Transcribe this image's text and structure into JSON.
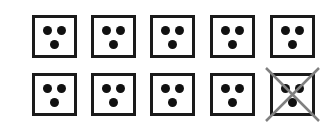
{
  "diagram": {
    "rows": 2,
    "columns": 5,
    "box_left_positions": [
      32,
      91,
      150,
      210,
      270
    ],
    "box_top_positions": [
      15,
      73
    ],
    "dots_per_box": 3,
    "boxes": [
      {
        "row": 0,
        "col": 0,
        "dots": 3,
        "crossed": false
      },
      {
        "row": 0,
        "col": 1,
        "dots": 3,
        "crossed": false
      },
      {
        "row": 0,
        "col": 2,
        "dots": 3,
        "crossed": false
      },
      {
        "row": 0,
        "col": 3,
        "dots": 3,
        "crossed": false
      },
      {
        "row": 0,
        "col": 4,
        "dots": 3,
        "crossed": false
      },
      {
        "row": 1,
        "col": 0,
        "dots": 3,
        "crossed": false
      },
      {
        "row": 1,
        "col": 1,
        "dots": 3,
        "crossed": false
      },
      {
        "row": 1,
        "col": 2,
        "dots": 3,
        "crossed": false
      },
      {
        "row": 1,
        "col": 3,
        "dots": 3,
        "crossed": false
      },
      {
        "row": 1,
        "col": 4,
        "dots": 3,
        "crossed": true
      }
    ],
    "colors": {
      "border": "#1a1a1a",
      "dot": "#111111",
      "cross": "#808080",
      "background": "#ffffff"
    }
  }
}
